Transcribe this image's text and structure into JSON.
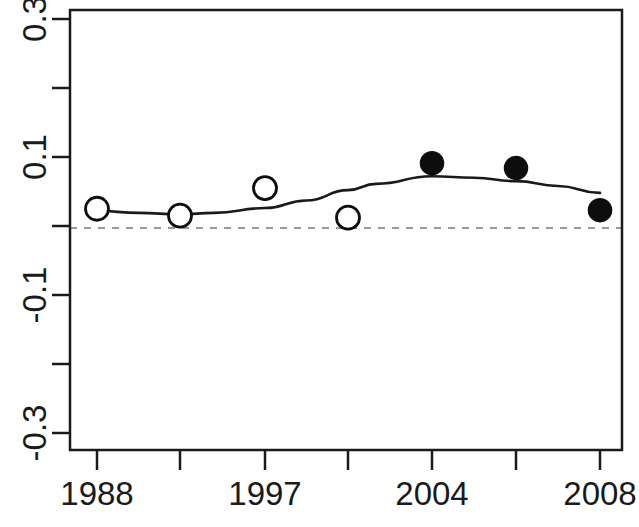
{
  "chart_data": {
    "type": "scatter",
    "title": "",
    "subtitle": "",
    "xlabel": "",
    "ylabel": "",
    "xlim": [
      1986.4,
      1988.0
    ],
    "ylim": [
      -0.4,
      0.4
    ],
    "grid": false,
    "legend": null,
    "x_tick_labels": [
      "1988",
      "",
      "1997",
      "",
      "2004",
      "",
      "2008"
    ],
    "x_tick_values": [
      1988,
      1992,
      1997,
      2001,
      2004,
      2006,
      2008
    ],
    "y_tick_labels": [
      "0.3",
      "",
      "0.1",
      "",
      "-0.1",
      "",
      "-0.3"
    ],
    "y_tick_values": [
      0.3,
      0.2,
      0.1,
      0.0,
      -0.1,
      -0.2,
      -0.3
    ],
    "y_axis_minor_ticks": [
      0.2,
      0.0,
      -0.2
    ],
    "reference_line": {
      "y": 0.0,
      "style": "dashed",
      "color": "#999999"
    },
    "series": [
      {
        "name": "observations",
        "type": "scatter",
        "x": [
          1988,
          1992,
          1997,
          2001,
          2004,
          2006,
          2008
        ],
        "values": [
          0.025,
          0.015,
          0.055,
          0.012,
          0.091,
          0.084,
          0.023
        ],
        "marker": "circle",
        "fill_flags": [
          false,
          false,
          false,
          false,
          true,
          true,
          true
        ],
        "open_marker_color": "#ffffff",
        "filled_marker_color": "#0d0d0d",
        "edge_color": "#0d0d0d"
      },
      {
        "name": "smooth-trend",
        "type": "line",
        "color": "#1a1a1a",
        "x": [
          1988,
          1990,
          1992,
          1994,
          1997,
          1999,
          2001,
          2002,
          2004,
          2005,
          2006,
          2007,
          2008
        ],
        "values": [
          0.022,
          0.019,
          0.017,
          0.019,
          0.026,
          0.037,
          0.052,
          0.061,
          0.072,
          0.07,
          0.065,
          0.058,
          0.048
        ]
      }
    ]
  },
  "axes": {
    "box_color": "#1a1a1a",
    "tick_color": "#1a1a1a"
  }
}
